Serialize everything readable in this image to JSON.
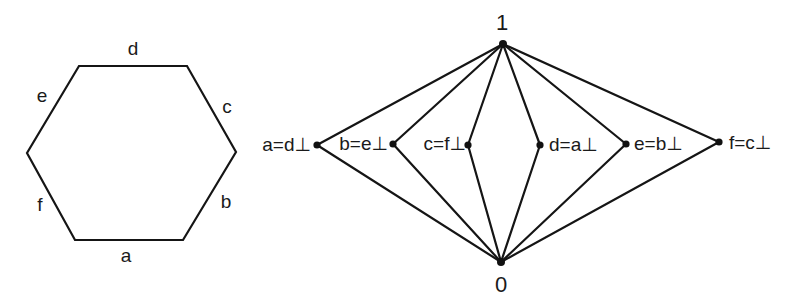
{
  "hexagon": {
    "side_labels": {
      "top": "d",
      "upper_right": "c",
      "lower_right": "b",
      "bottom": "a",
      "lower_left": "f",
      "upper_left": "e"
    }
  },
  "lattice": {
    "top_label": "1",
    "bottom_label": "0",
    "atoms": [
      {
        "id": "a",
        "label": "a=d⊥"
      },
      {
        "id": "b",
        "label": "b=e⊥"
      },
      {
        "id": "c",
        "label": "c=f⊥"
      },
      {
        "id": "d",
        "label": "d=a⊥"
      },
      {
        "id": "e",
        "label": "e=b⊥"
      },
      {
        "id": "f",
        "label": "f=c⊥"
      }
    ]
  },
  "colors": {
    "stroke": "#151515",
    "background": "#ffffff"
  }
}
